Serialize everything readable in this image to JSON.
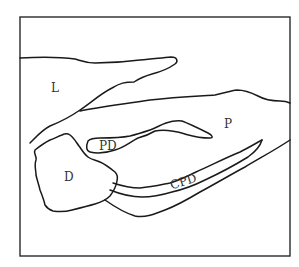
{
  "diagram": {
    "type": "anatomical line drawing",
    "labels": {
      "liver": "L",
      "pancreas": "P",
      "pancreatic_duct": "PD",
      "duodenum": "D",
      "common_pancreatic_duct": "CPD"
    },
    "colors": {
      "line": "#1a1a1a",
      "frame": "#2a2a2a",
      "text": "#333333",
      "background": "#ffffff"
    }
  }
}
